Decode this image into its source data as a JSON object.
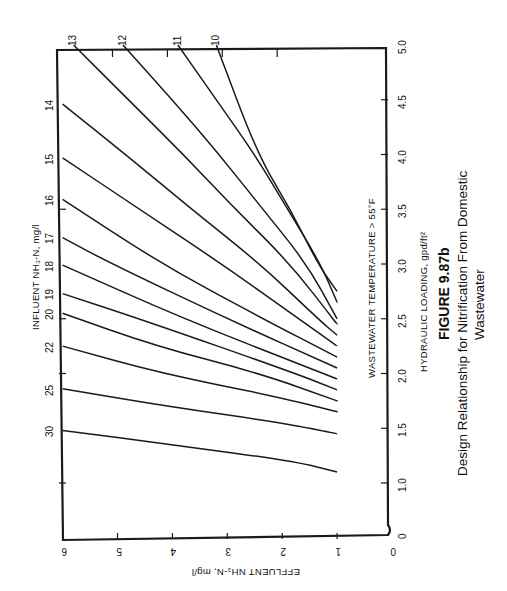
{
  "figure": {
    "number": "FIGURE 9.87b",
    "caption_line1": "Design Relationship for Nitrification From Domestic",
    "caption_line2": "Wastewater",
    "annotation": "WASTEWATER TEMPERATURE > 55°F"
  },
  "axes": {
    "hydraulic": {
      "title": "HYDRAULIC LOADING, gpd/ft²",
      "ticks": [
        "0",
        "1.0",
        "1.5",
        "2.0",
        "2.5",
        "3.0",
        "3.5",
        "4.0",
        "4.5",
        "5.0"
      ]
    },
    "effluent": {
      "title": "EFFLUENT NH₃-N, mg/l",
      "ticks": [
        "0",
        "1",
        "2",
        "3",
        "4",
        "5",
        "6"
      ]
    },
    "influent": {
      "title": "INFLUENT NH₃-N, mg/l"
    }
  },
  "colors": {
    "line": "#1a1a1a",
    "background": "#ffffff"
  },
  "chart_data": {
    "type": "line",
    "subtitle": "WASTEWATER TEMPERATURE > 55°F",
    "xlabel": "HYDRAULIC LOADING, gpd/ft²",
    "ylabel": "EFFLUENT NH₃-N, mg/l",
    "series_label": "INFLUENT NH₃-N, mg/l",
    "xlim": [
      0,
      5.0
    ],
    "ylim": [
      0,
      6
    ],
    "x_axis_break": [
      0,
      1.0
    ],
    "orientation_note": "figure printed rotated 90°",
    "grid": false,
    "series": [
      {
        "name": "10",
        "points": [
          [
            5.0,
            3.2
          ],
          [
            4.0,
            2.45
          ],
          [
            3.5,
            1.85
          ],
          [
            3.0,
            1.35
          ],
          [
            2.75,
            1.0
          ]
        ]
      },
      {
        "name": "11",
        "points": [
          [
            5.0,
            3.9
          ],
          [
            4.5,
            3.2
          ],
          [
            4.0,
            2.5
          ],
          [
            3.5,
            1.9
          ],
          [
            3.0,
            1.3
          ],
          [
            2.65,
            1.0
          ]
        ]
      },
      {
        "name": "12",
        "points": [
          [
            5.0,
            4.9
          ],
          [
            4.5,
            4.0
          ],
          [
            4.0,
            3.15
          ],
          [
            3.5,
            2.35
          ],
          [
            3.0,
            1.55
          ],
          [
            2.5,
            1.0
          ]
        ]
      },
      {
        "name": "13",
        "points": [
          [
            5.0,
            5.8
          ],
          [
            4.5,
            4.8
          ],
          [
            4.0,
            3.8
          ],
          [
            3.5,
            2.85
          ],
          [
            3.0,
            1.85
          ],
          [
            2.45,
            1.0
          ]
        ]
      },
      {
        "name": "14",
        "points": [
          [
            4.46,
            6.0
          ],
          [
            4.0,
            4.85
          ],
          [
            3.5,
            3.65
          ],
          [
            3.0,
            2.4
          ],
          [
            2.5,
            1.35
          ],
          [
            2.35,
            1.0
          ]
        ]
      },
      {
        "name": "15",
        "points": [
          [
            3.97,
            6.0
          ],
          [
            3.5,
            4.6
          ],
          [
            3.0,
            3.1
          ],
          [
            2.5,
            1.7
          ],
          [
            2.25,
            1.0
          ]
        ]
      },
      {
        "name": "16",
        "points": [
          [
            3.59,
            6.0
          ],
          [
            3.0,
            4.2
          ],
          [
            2.5,
            2.35
          ],
          [
            2.15,
            1.0
          ]
        ]
      },
      {
        "name": "17",
        "points": [
          [
            3.24,
            6.0
          ],
          [
            3.0,
            5.1
          ],
          [
            2.5,
            3.0
          ],
          [
            2.05,
            1.0
          ]
        ]
      },
      {
        "name": "18",
        "points": [
          [
            2.99,
            6.0
          ],
          [
            2.5,
            3.8
          ],
          [
            2.0,
            1.25
          ],
          [
            1.95,
            1.0
          ]
        ]
      },
      {
        "name": "19",
        "points": [
          [
            2.73,
            6.0
          ],
          [
            2.5,
            4.6
          ],
          [
            2.0,
            1.75
          ],
          [
            1.85,
            1.0
          ]
        ]
      },
      {
        "name": "20",
        "points": [
          [
            2.55,
            6.0
          ],
          [
            2.25,
            4.3
          ],
          [
            2.0,
            2.4
          ],
          [
            1.75,
            1.0
          ]
        ]
      },
      {
        "name": "22",
        "points": [
          [
            2.25,
            6.0
          ],
          [
            2.0,
            4.2
          ],
          [
            1.8,
            2.2
          ],
          [
            1.65,
            1.0
          ]
        ]
      },
      {
        "name": "25",
        "points": [
          [
            1.86,
            6.0
          ],
          [
            1.7,
            4.1
          ],
          [
            1.55,
            2.0
          ],
          [
            1.45,
            1.0
          ]
        ]
      },
      {
        "name": "30",
        "points": [
          [
            1.48,
            6.0
          ],
          [
            1.35,
            4.0
          ],
          [
            1.2,
            1.8
          ],
          [
            1.1,
            1.0
          ]
        ]
      }
    ]
  }
}
